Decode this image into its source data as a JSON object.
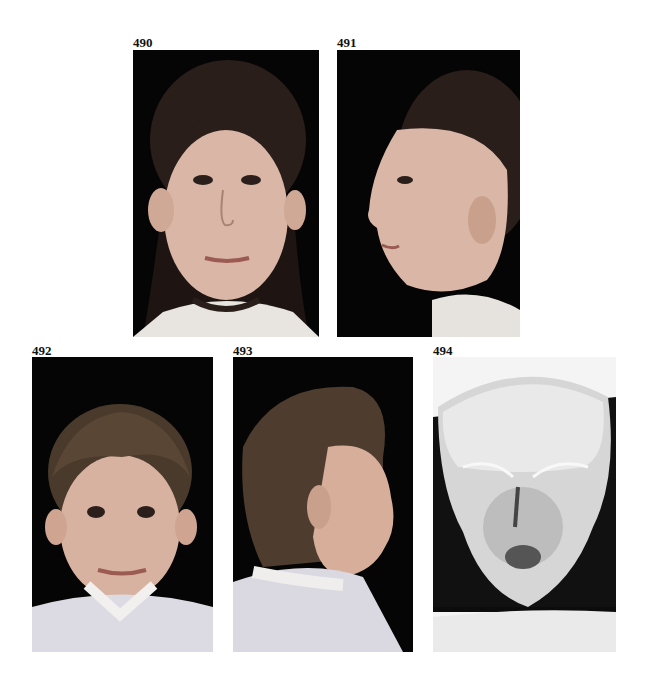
{
  "figures": [
    {
      "number": "490",
      "description": "Frontal portrait of girl with dark hair, freckles, prominent ears"
    },
    {
      "number": "491",
      "description": "Profile portrait of same girl facing left, showing ear"
    },
    {
      "number": "492",
      "description": "Frontal portrait of young boy with short hair in checked shirt"
    },
    {
      "number": "493",
      "description": "Profile portrait of boy facing right, checked shirt with collar"
    },
    {
      "number": "494",
      "description": "Skull radiograph, posteroanterior view"
    }
  ]
}
